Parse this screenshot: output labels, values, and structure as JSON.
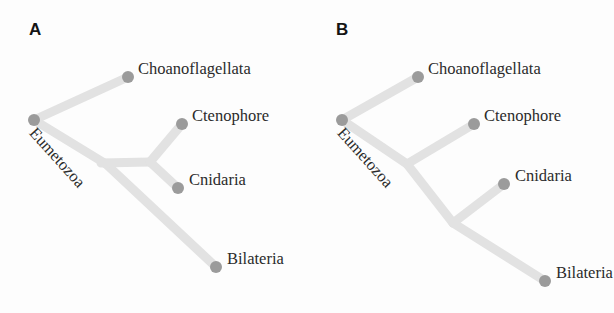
{
  "figure": {
    "background_color": "#fdfdfd",
    "branch_color": "#e2e2e2",
    "node_color": "#9b9b9b",
    "text_color": "#2b2b2b",
    "panel_label_color": "#141414"
  },
  "panels": [
    {
      "id": "a",
      "label": "A",
      "root_label": "Eumetozoa",
      "root_label_rotation_deg": 48,
      "topology": "Ctenophora+Cnidaria sister clade (Coelenterata)",
      "tips": [
        {
          "name": "Choanoflagellata",
          "label": "Choanoflagellata",
          "x": 128,
          "y": 77
        },
        {
          "name": "Ctenophore",
          "label": "Ctenophore",
          "x": 182,
          "y": 124
        },
        {
          "name": "Cnidaria",
          "label": "Cnidaria",
          "x": 178,
          "y": 188
        },
        {
          "name": "Bilateria",
          "label": "Bilateria",
          "x": 216,
          "y": 267
        }
      ],
      "root_node": {
        "x": 34,
        "y": 120
      },
      "internal_nodes": [
        {
          "name": "eumetazoa-split",
          "x": 105,
          "y": 164
        },
        {
          "name": "coelenterata-split",
          "x": 148,
          "y": 163
        }
      ]
    },
    {
      "id": "b",
      "label": "B",
      "root_label": "Eumetozoa",
      "root_label_rotation_deg": 48,
      "topology": "Ctenophora then Cnidaria successive sister groups (pectinate)",
      "tips": [
        {
          "name": "Choanoflagellata",
          "label": "Choanoflagellata",
          "x": 418,
          "y": 77
        },
        {
          "name": "Ctenophore",
          "label": "Ctenophore",
          "x": 474,
          "y": 124
        },
        {
          "name": "Cnidaria",
          "label": "Cnidaria",
          "x": 504,
          "y": 184
        },
        {
          "name": "Bilateria",
          "label": "Bilateria",
          "x": 545,
          "y": 281
        }
      ],
      "root_node": {
        "x": 342,
        "y": 120
      },
      "internal_nodes": [
        {
          "name": "eumetazoa-split",
          "x": 406,
          "y": 164
        },
        {
          "name": "cnidaria-bilateria-split",
          "x": 452,
          "y": 222
        }
      ]
    }
  ]
}
